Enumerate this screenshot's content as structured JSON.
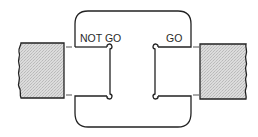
{
  "diagram": {
    "type": "snap-gauge",
    "labels": {
      "not_go": "NOT GO",
      "go": "GO"
    },
    "colors": {
      "line": "#222222",
      "workpiece_fill": "#d6d6d6",
      "background": "#ffffff"
    },
    "parts": [
      {
        "id": "gauge-frame",
        "description": "C-shaped snap gauge frame with two jaws"
      },
      {
        "id": "not-go-jaw",
        "label": "NOT GO"
      },
      {
        "id": "go-jaw",
        "label": "GO"
      },
      {
        "id": "left-workpiece",
        "description": "shaded workpiece section with broken edge"
      },
      {
        "id": "right-workpiece",
        "description": "shaded workpiece section with broken edge"
      }
    ]
  }
}
